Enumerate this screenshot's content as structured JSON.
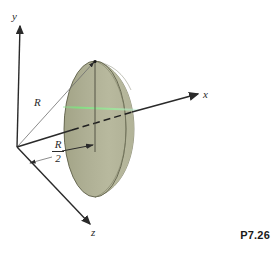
{
  "figure": {
    "problem_tag": "P7.26",
    "axes": [
      {
        "name": "y",
        "label": "y",
        "direction": "up"
      },
      {
        "name": "x",
        "label": "x",
        "direction": "right"
      },
      {
        "name": "z",
        "label": "z",
        "direction": "lower-left-front"
      }
    ],
    "dimensions": [
      {
        "name": "radius",
        "label": "R"
      },
      {
        "name": "half-radius",
        "numerator": "R",
        "denominator": "2"
      }
    ],
    "colors": {
      "disk_fill": "#a9aa8e",
      "disk_highlight": "#d7d8c6",
      "disk_edge": "#55553f",
      "axis_line": "#2a2a2a",
      "leader_line": "#6e6e6e",
      "accent_green": "#8fe08f",
      "background": "#ffffff",
      "text": "#2a2a2a"
    },
    "geometry": {
      "origin": [
        17,
        147
      ],
      "y_axis_tip": [
        20,
        22
      ],
      "x_axis_tip": [
        200,
        93
      ],
      "z_axis_tip": [
        92,
        228
      ],
      "disk_center": [
        95,
        129
      ],
      "disk_rx": 31,
      "disk_ry": 68,
      "half_radius_mark_x": 95
    }
  }
}
